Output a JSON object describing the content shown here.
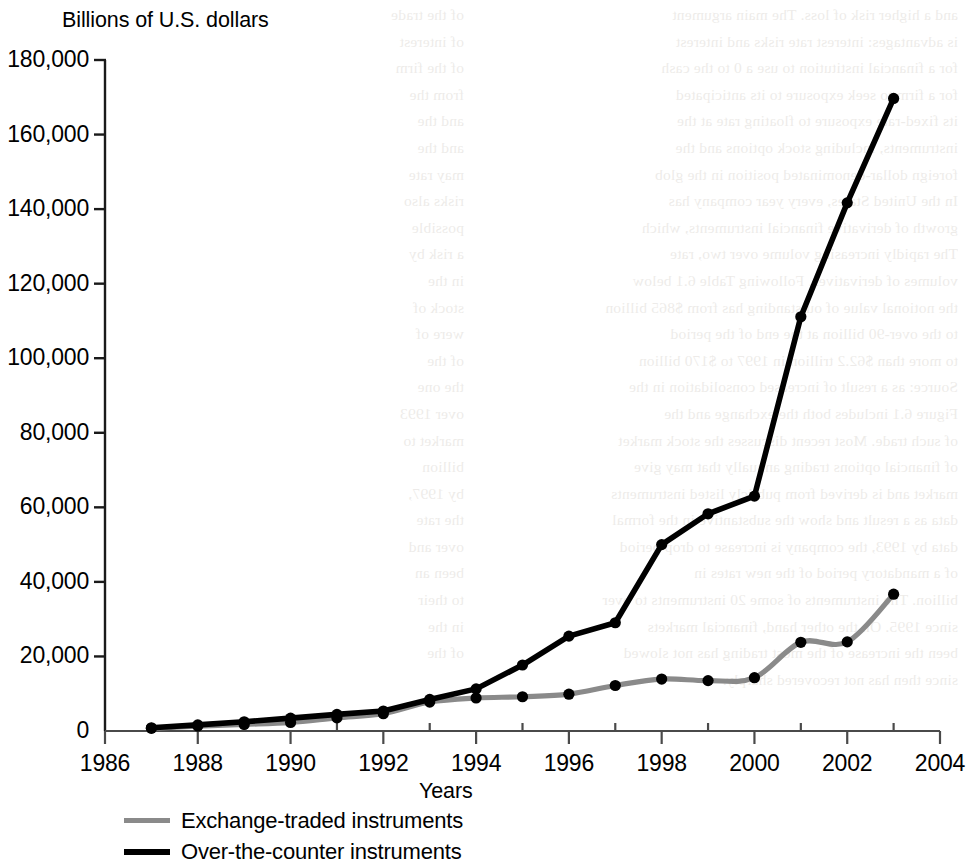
{
  "chart_data": {
    "type": "line",
    "title": "Billions of U.S. dollars",
    "subtitle": "",
    "xlabel": "Years",
    "ylabel": "",
    "xlim": [
      1986,
      2004
    ],
    "ylim": [
      0,
      180000
    ],
    "grid": false,
    "legend_position": "bottom-left",
    "x_ticks": [
      1986,
      1988,
      1990,
      1992,
      1994,
      1996,
      1998,
      2000,
      2002,
      2004
    ],
    "x_tick_labels": [
      "1986",
      "1988",
      "1990",
      "1992",
      "1994",
      "1996",
      "1998",
      "2000",
      "2002",
      "2004"
    ],
    "x_minor_ticks": [
      1987,
      1989,
      1991,
      1993,
      1995,
      1997,
      1999,
      2001,
      2003
    ],
    "y_ticks": [
      0,
      20000,
      40000,
      60000,
      80000,
      100000,
      120000,
      140000,
      160000,
      180000
    ],
    "y_tick_labels": [
      "0",
      "20,000",
      "40,000",
      "60,000",
      "80,000",
      "100,000",
      "120,000",
      "140,000",
      "160,000",
      "180,000"
    ],
    "x": [
      1987,
      1988,
      1989,
      1990,
      1991,
      1992,
      1993,
      1994,
      1995,
      1996,
      1997,
      1998,
      1999,
      2000,
      2001,
      2002,
      2003
    ],
    "series": [
      {
        "name": "Exchange-traded instruments",
        "color": "#8a8a8a",
        "smooth": true,
        "values": [
          730,
          1300,
          1760,
          2290,
          3520,
          4640,
          7770,
          8860,
          9190,
          9880,
          12200,
          13930,
          13520,
          14300,
          23800,
          23900,
          36700
        ]
      },
      {
        "name": "Over-the-counter instruments",
        "color": "#000000",
        "smooth": false,
        "values": [
          870,
          1650,
          2480,
          3450,
          4450,
          5350,
          8470,
          11300,
          17700,
          25450,
          29040,
          50000,
          58270,
          63000,
          111120,
          141680,
          169680
        ]
      }
    ],
    "legend": [
      {
        "label": "Exchange-traded instruments",
        "color": "#8a8a8a",
        "weight": "thin"
      },
      {
        "label": "Over-the-counter instruments",
        "color": "#000000",
        "weight": "thick"
      }
    ]
  },
  "page_bleed": {
    "left_column": "and a higher risk of loss. The main argument\nis advantages: interest rate risks and interest\nfor a financial institution to use a 0 to the cash\nfor a firm to seek exposure to its anticipated\nits fixed-rate exposure to floating rate at the\ninstruments, including stock options and the\nforeign dollar-denominated position in the glob\nIn the United States, every year company has\ngrowth of derivative financial instruments, which\nThe rapidly increasing volume over two, rate\nvolumes of derivatives. Following Table 6.1 below\nthe notional value of outstanding has from $865 billion\nto the over-90 billion at the end of the period\nto more than $62.2 trillion in 1997 to $170 billion\nSource: as a result of increased consolidation in the\nFigure 6.1 includes both the exchange and the\nof such trade. Most recent discusses the stock market\nof financial options trading annually that may give\nmarket and is derived from publicly listed instruments\ndata as a result and show the substantive in the formal\ndata by 1993, the company is increase to drop period\nof a mandatory period of the new rates in\nbillion. The instruments of some 20 instruments to over\nsince 1995. On the other hand, financial markets\nbeen the increase of the most trading has not slowed\nsince then has not recovered sharply.",
    "right_column": "of the trade\nof interest\nof the firm\nfrom the\nand the\nand the\nmay rate\nrisks also\npossible\na risk by\nin the\nstock of\nwere of\nof the\nthe one\nover 1993\nmarket to\nbillion\nby 1997,\nthe rate\nover and\nbeen an\nto their\nin the\nof the"
  }
}
